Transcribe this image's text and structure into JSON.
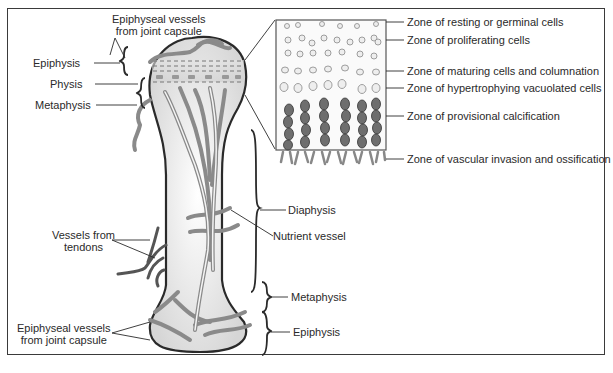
{
  "diagram": {
    "bone_labels_left": {
      "epiphyseal_top": [
        "Epiphyseal vessels",
        "from joint capsule"
      ],
      "epiphysis": "Epiphysis",
      "physis": "Physis",
      "metaphysis": "Metaphysis",
      "vessels_tendons": [
        "Vessels from",
        "tendons"
      ],
      "epiphyseal_bottom": [
        "Epiphyseal vessels",
        "from joint capsule"
      ]
    },
    "bone_labels_right": {
      "diaphysis": "Diaphysis",
      "nutrient_vessel": "Nutrient vessel",
      "metaphysis": "Metaphysis",
      "epiphysis": "Epiphysis"
    },
    "growth_plate_zones": [
      "Zone of resting or germinal cells",
      "Zone of proliferating cells",
      "Zone of maturing cells and columnation",
      "Zone of hypertrophying vacuolated cells",
      "Zone of provisional calcification",
      "Zone of vascular invasion and ossification"
    ],
    "colors": {
      "outline": "#2a2a2a",
      "vessel": "#8a8a8a",
      "vessel_dark": "#555555",
      "cell_dark": "#6e6e6e",
      "bone_fill": "#f2f2f2"
    }
  }
}
